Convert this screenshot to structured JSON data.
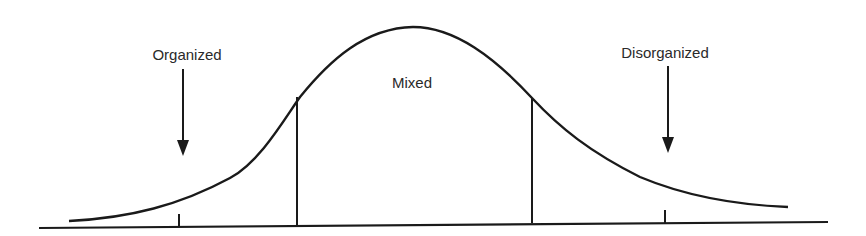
{
  "diagram": {
    "type": "bell-curve",
    "labels": {
      "left": "Organized",
      "center": "Mixed",
      "right": "Disorganized"
    },
    "line_color": "#1a1a1a",
    "text_color": "#2a2a2a"
  }
}
